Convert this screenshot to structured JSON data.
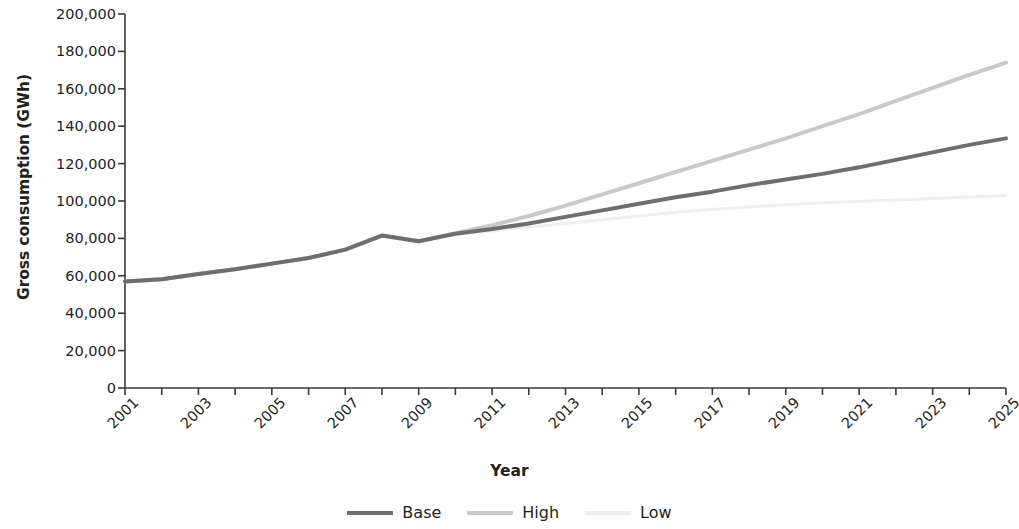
{
  "chart_data": {
    "type": "line",
    "title": "",
    "xlabel": "Year",
    "ylabel": "Gross consumption (GWh)",
    "xlim": [
      2001,
      2025
    ],
    "ylim": [
      0,
      200000
    ],
    "yticks": [
      0,
      20000,
      40000,
      60000,
      80000,
      100000,
      120000,
      140000,
      160000,
      180000,
      200000
    ],
    "ytick_labels": [
      "0",
      "20,000",
      "40,000",
      "60,000",
      "80,000",
      "100,000",
      "120,000",
      "140,000",
      "160,000",
      "180,000",
      "200,000"
    ],
    "x": [
      2001,
      2002,
      2003,
      2004,
      2005,
      2006,
      2007,
      2008,
      2009,
      2010,
      2011,
      2012,
      2013,
      2014,
      2015,
      2016,
      2017,
      2018,
      2019,
      2020,
      2021,
      2022,
      2023,
      2024,
      2025
    ],
    "xtick_labels": [
      "2001",
      "",
      "2003",
      "",
      "2005",
      "",
      "2007",
      "",
      "2009",
      "",
      "2011",
      "",
      "2013",
      "",
      "2015",
      "",
      "2017",
      "",
      "2019",
      "",
      "2021",
      "",
      "2023",
      "",
      "2025"
    ],
    "xtick_labels_shown": [
      "2001",
      "2003",
      "2005",
      "2007",
      "2009",
      "2011",
      "2013",
      "2015",
      "2017",
      "2019",
      "2021",
      "2023",
      "2025"
    ],
    "xtick_rotation_deg": -45,
    "grid": false,
    "legend_position": "bottom",
    "series": [
      {
        "name": "Base",
        "color": "#6e6e6e",
        "width": 4,
        "values": [
          57000,
          58200,
          61000,
          63500,
          66500,
          69500,
          74000,
          81500,
          78500,
          82500,
          85000,
          88000,
          91500,
          95000,
          98500,
          102000,
          105000,
          108500,
          111500,
          114500,
          118000,
          122000,
          126000,
          130000,
          133500
        ]
      },
      {
        "name": "High",
        "color": "#c9c9c9",
        "width": 4,
        "values": [
          57000,
          58200,
          61000,
          63500,
          66500,
          69500,
          74000,
          81500,
          78500,
          82800,
          87000,
          92000,
          97500,
          103500,
          109500,
          115500,
          121500,
          127500,
          133500,
          140000,
          146500,
          153500,
          160500,
          167500,
          174000
        ]
      },
      {
        "name": "Low",
        "color": "#efefef",
        "width": 3,
        "values": [
          57000,
          58200,
          61000,
          63500,
          66500,
          69500,
          74000,
          81500,
          78500,
          82200,
          84000,
          86000,
          88000,
          90000,
          92000,
          94000,
          95500,
          96800,
          98000,
          99000,
          99800,
          100600,
          101400,
          102200,
          103000
        ]
      }
    ]
  },
  "legend": {
    "items": [
      {
        "label": "Base",
        "color": "#6e6e6e",
        "style": "solid"
      },
      {
        "label": "High",
        "color": "#c9c9c9",
        "style": "solid"
      },
      {
        "label": "Low",
        "color": "#efefef",
        "style": "solid"
      }
    ]
  },
  "axis": {
    "y_title": "Gross consumption (GWh)",
    "x_title": "Year",
    "axis_color": "#3a3a3a"
  }
}
